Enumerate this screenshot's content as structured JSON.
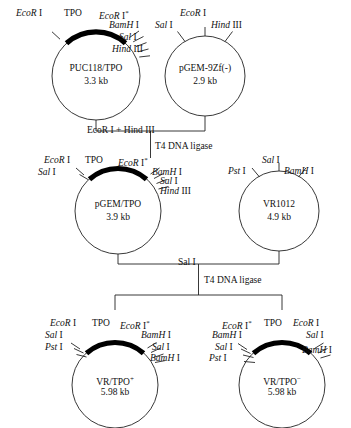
{
  "figure": {
    "background": "#ffffff",
    "ink": "#111111"
  },
  "plasmids": [
    {
      "id": "puc118-tpo",
      "name": "PUC118/TPO",
      "size": "3.3 kb",
      "has_insert": true,
      "insert_label": "TPO",
      "sites": [
        {
          "enzyme": "EcoR",
          "numeral": "I",
          "star": false
        },
        {
          "enzyme": "EcoR",
          "numeral": "I",
          "star": true
        },
        {
          "enzyme": "BamH",
          "numeral": "I",
          "star": false
        },
        {
          "enzyme": "Sal",
          "numeral": "I",
          "star": false
        },
        {
          "enzyme": "Hind",
          "numeral": "III",
          "star": false
        }
      ]
    },
    {
      "id": "pgem-9zf",
      "name": "pGEM-9Zf(-)",
      "size": "2.9 kb",
      "has_insert": false,
      "insert_label": "",
      "sites": [
        {
          "enzyme": "Sal",
          "numeral": "I",
          "star": false
        },
        {
          "enzyme": "EcoR",
          "numeral": "I",
          "star": false
        },
        {
          "enzyme": "Hind",
          "numeral": "III",
          "star": false
        }
      ]
    },
    {
      "id": "pgem-tpo",
      "name": "pGEM/TPO",
      "size": "3.9 kb",
      "has_insert": true,
      "insert_label": "TPO",
      "sites": [
        {
          "enzyme": "EcoR",
          "numeral": "I",
          "star": false
        },
        {
          "enzyme": "Sal",
          "numeral": "I",
          "star": false
        },
        {
          "enzyme": "EcoR",
          "numeral": "I",
          "star": true
        },
        {
          "enzyme": "BamH",
          "numeral": "I",
          "star": false
        },
        {
          "enzyme": "Sal",
          "numeral": "I",
          "star": false
        },
        {
          "enzyme": "Hind",
          "numeral": "III",
          "star": false
        }
      ]
    },
    {
      "id": "vr1012",
      "name": "VR1012",
      "size": "4.9 kb",
      "has_insert": false,
      "insert_label": "",
      "sites": [
        {
          "enzyme": "Pst",
          "numeral": "I",
          "star": false
        },
        {
          "enzyme": "Sal",
          "numeral": "I",
          "star": false
        },
        {
          "enzyme": "BamH",
          "numeral": "I",
          "star": false
        }
      ]
    },
    {
      "id": "vr-tpo-plus",
      "name": "VR/TPO",
      "name_superscript": "+",
      "size": "5.98 kb",
      "has_insert": true,
      "insert_label": "TPO",
      "sites": [
        {
          "enzyme": "EcoR",
          "numeral": "I",
          "star": false
        },
        {
          "enzyme": "Sal",
          "numeral": "I",
          "star": false
        },
        {
          "enzyme": "Pst",
          "numeral": "I",
          "star": false
        },
        {
          "enzyme": "EcoR",
          "numeral": "I",
          "star": true
        },
        {
          "enzyme": "BamH",
          "numeral": "I",
          "star": false
        },
        {
          "enzyme": "Sal",
          "numeral": "I",
          "star": false
        },
        {
          "enzyme": "BamH",
          "numeral": "I",
          "star": false
        }
      ]
    },
    {
      "id": "vr-tpo-minus",
      "name": "VR/TPO",
      "name_superscript": "−",
      "size": "5.98 kb",
      "has_insert": true,
      "insert_label": "TPO",
      "sites": [
        {
          "enzyme": "EcoR",
          "numeral": "I",
          "star": true
        },
        {
          "enzyme": "BamH",
          "numeral": "I",
          "star": false
        },
        {
          "enzyme": "Sal",
          "numeral": "I",
          "star": false
        },
        {
          "enzyme": "Pst",
          "numeral": "I",
          "star": false
        },
        {
          "enzyme": "EcoR",
          "numeral": "I",
          "star": false
        },
        {
          "enzyme": "Sal",
          "numeral": "I",
          "star": false
        },
        {
          "enzyme": "BamH",
          "numeral": "I",
          "star": false
        }
      ]
    }
  ],
  "labels": {
    "p1": {
      "ecorI": "EcoR",
      "ecorI_num": "I",
      "tpo": "TPO",
      "ecorI_star": "EcoR",
      "ecorI_star_num": "I",
      "star": "*",
      "bamhI": "BamH",
      "bamhI_num": "I",
      "salI": "Sal",
      "salI_num": "I",
      "hindIII": "Hind",
      "hindIII_num": "III",
      "name": "PUC118/TPO",
      "size": "3.3 kb"
    },
    "p2": {
      "salI": "Sal",
      "salI_num": "I",
      "ecorI": "EcoR",
      "ecorI_num": "I",
      "hindIII": "Hind",
      "hindIII_num": "III",
      "name": "pGEM-9Zf(-)",
      "size": "2.9 kb"
    },
    "p3": {
      "ecorI": "EcoR",
      "ecorI_num": "I",
      "tpo": "TPO",
      "ecorI_star": "EcoR",
      "ecorI_star_num": "I",
      "star": "*",
      "salI_left": "Sal",
      "salI_left_num": "I",
      "bamhI": "BamH",
      "bamhI_num": "I",
      "salI": "Sal",
      "salI_num": "I",
      "hindIII": "Hind",
      "hindIII_num": "III",
      "name": "pGEM/TPO",
      "size": "3.9 kb"
    },
    "p4": {
      "pstI": "Pst",
      "pstI_num": "I",
      "salI": "Sal",
      "salI_num": "I",
      "bamhI": "BamH",
      "bamhI_num": "I",
      "name": "VR1012",
      "size": "4.9 kb"
    },
    "p5": {
      "ecorI": "EcoR",
      "ecorI_num": "I",
      "tpo": "TPO",
      "ecorI_star": "EcoR",
      "ecorI_star_num": "I",
      "star": "*",
      "salI_left": "Sal",
      "salI_left_num": "I",
      "pstI": "Pst",
      "pstI_num": "I",
      "bamhI_top": "BamH",
      "bamhI_top_num": "I",
      "salI_right": "Sal",
      "salI_right_num": "I",
      "bamhI_bot": "BamH",
      "bamhI_bot_num": "I",
      "name": "VR/TPO",
      "name_sup": "+",
      "size": "5.98 kb"
    },
    "p6": {
      "ecorI_star": "EcoR",
      "ecorI_star_num": "I",
      "star": "*",
      "tpo": "TPO",
      "ecorI": "EcoR",
      "ecorI_num": "I",
      "bamhI_left": "BamH",
      "bamhI_left_num": "I",
      "salI_left": "Sal",
      "salI_left_num": "I",
      "pstI": "Pst",
      "pstI_num": "I",
      "salI_right": "Sal",
      "salI_right_num": "I",
      "bamhI_right": "BamH",
      "bamhI_right_num": "I",
      "name": "VR/TPO",
      "name_sup": "−",
      "size": "5.98 kb"
    }
  },
  "steps": [
    {
      "id": "step-1",
      "digest": {
        "enzyme_a": "EcoR",
        "numeral_a": "I",
        "plus": "+",
        "enzyme_b": "Hind",
        "numeral_b": "III"
      },
      "ligase": "T4 DNA ligase"
    },
    {
      "id": "step-2",
      "digest": {
        "enzyme_a": "Sal",
        "numeral_a": "I",
        "plus": "",
        "enzyme_b": "",
        "numeral_b": ""
      },
      "ligase": "T4 DNA ligase"
    }
  ]
}
